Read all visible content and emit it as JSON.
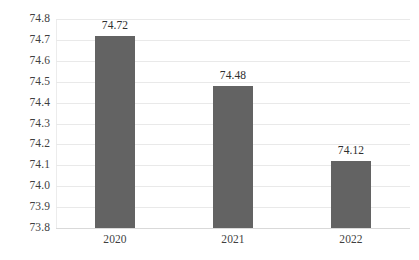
{
  "chart_data": {
    "type": "bar",
    "title": "",
    "subtitle": "",
    "xlabel": "",
    "ylabel": "",
    "categories": [
      "2020",
      "2021",
      "2022"
    ],
    "values": [
      74.72,
      74.48,
      74.12
    ],
    "data_labels": [
      "74.72",
      "74.48",
      "74.12"
    ],
    "ylim": [
      73.8,
      74.8
    ],
    "ytick_step": 0.1,
    "ytick_labels": [
      "74.8",
      "74.7",
      "74.6",
      "74.5",
      "74.4",
      "74.3",
      "74.2",
      "74.1",
      "74.0",
      "73.9",
      "73.8"
    ],
    "ytick_values": [
      74.8,
      74.7,
      74.6,
      74.5,
      74.4,
      74.3,
      74.2,
      74.1,
      74.0,
      73.9,
      73.8
    ],
    "grid": true,
    "grid_axis": "y",
    "legend": false,
    "legend_position": "none",
    "series": [
      {
        "name": "",
        "values": [
          74.72,
          74.48,
          74.12
        ]
      }
    ],
    "colors": {
      "bar": "#636363",
      "gridline": "#e9e9e9",
      "axis_line": "#d9d9d9",
      "tick_text": "#3f3f3f",
      "label_text": "#2f2f2f",
      "background": "#ffffff"
    }
  }
}
